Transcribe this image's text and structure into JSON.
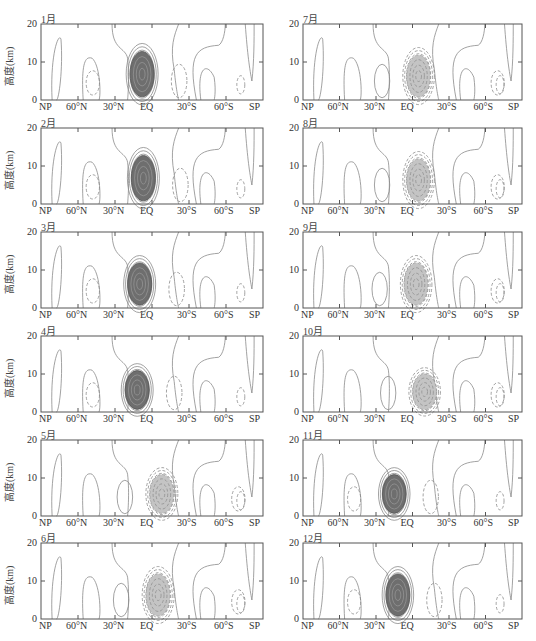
{
  "figure": {
    "ylabel": "高度(km)",
    "yticks": [
      "0",
      "10",
      "20"
    ],
    "xticks": [
      "NP",
      "60°N",
      "30°N",
      "EQ",
      "30°S",
      "60°S",
      "SP"
    ]
  },
  "chart_data": {
    "type": "contour",
    "title": "",
    "xlabel": "",
    "ylabel": "高度(km)",
    "x_categories": [
      "NP",
      "60°N",
      "30°N",
      "EQ",
      "30°S",
      "60°S",
      "SP"
    ],
    "ylim": [
      0,
      20
    ],
    "yticks": [
      0,
      10,
      20
    ],
    "legend": "solid contours = positive, dashed contours = negative; dark shading = strong positive core, light shading = strong negative core",
    "panels": [
      {
        "label": "1月",
        "core": {
          "sign": "positive",
          "lat": 8,
          "center_km": 7,
          "top_km": 13,
          "shade": "dark"
        }
      },
      {
        "label": "2月",
        "core": {
          "sign": "positive",
          "lat": 7,
          "center_km": 7,
          "top_km": 13,
          "shade": "dark"
        }
      },
      {
        "label": "3月",
        "core": {
          "sign": "positive",
          "lat": 10,
          "center_km": 7,
          "top_km": 12,
          "shade": "dark"
        }
      },
      {
        "label": "4月",
        "core": {
          "sign": "positive",
          "lat": 12,
          "center_km": 7,
          "top_km": 11,
          "shade": "dark"
        }
      },
      {
        "label": "5月",
        "core": {
          "sign": "negative",
          "lat": -8,
          "center_km": 6,
          "top_km": 11,
          "shade": "light"
        }
      },
      {
        "label": "6月",
        "core": {
          "sign": "negative",
          "lat": -5,
          "center_km": 6,
          "top_km": 12,
          "shade": "light"
        }
      },
      {
        "label": "7月",
        "core": {
          "sign": "negative",
          "lat": -5,
          "center_km": 6,
          "top_km": 12,
          "shade": "light"
        }
      },
      {
        "label": "8月",
        "core": {
          "sign": "negative",
          "lat": -5,
          "center_km": 6,
          "top_km": 12,
          "shade": "light"
        }
      },
      {
        "label": "9月",
        "core": {
          "sign": "negative",
          "lat": -3,
          "center_km": 6,
          "top_km": 12,
          "shade": "light"
        }
      },
      {
        "label": "10月",
        "core": {
          "sign": "negative",
          "lat": -10,
          "center_km": 6,
          "top_km": 10,
          "shade": "light"
        }
      },
      {
        "label": "11月",
        "core": {
          "sign": "positive",
          "lat": 15,
          "center_km": 6,
          "top_km": 11,
          "shade": "dark"
        }
      },
      {
        "label": "12月",
        "core": {
          "sign": "positive",
          "lat": 12,
          "center_km": 6,
          "top_km": 12,
          "shade": "dark"
        }
      }
    ]
  },
  "panels": [
    {
      "label": "1月"
    },
    {
      "label": "2月"
    },
    {
      "label": "3月"
    },
    {
      "label": "4月"
    },
    {
      "label": "5月"
    },
    {
      "label": "6月"
    },
    {
      "label": "7月"
    },
    {
      "label": "8月"
    },
    {
      "label": "9月"
    },
    {
      "label": "10月"
    },
    {
      "label": "11月"
    },
    {
      "label": "12月"
    }
  ]
}
